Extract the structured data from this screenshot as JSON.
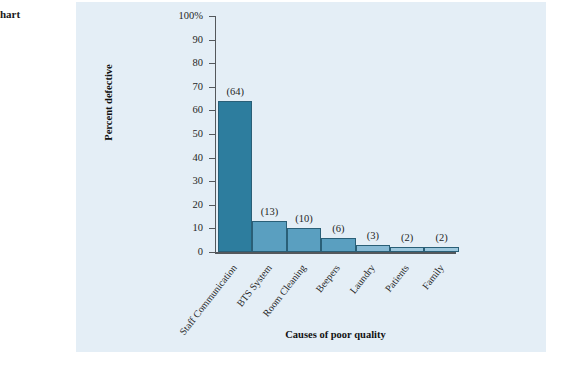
{
  "caption_fragment": "hart",
  "panel": {
    "background_color": "#e4eef6"
  },
  "chart_data": {
    "type": "bar",
    "title": "",
    "xlabel": "Causes of poor quality",
    "ylabel": "Percent defective",
    "categories": [
      "Staff Communication",
      "BTS System",
      "Room Cleaning",
      "Beepers",
      "Laundry",
      "Patients",
      "Family"
    ],
    "values": [
      64,
      13,
      10,
      6,
      3,
      2,
      2
    ],
    "data_labels": [
      "(64)",
      "(13)",
      "(10)",
      "(6)",
      "(3)",
      "(2)",
      "(2)"
    ],
    "ylim": [
      0,
      100
    ],
    "yticks": [
      0,
      10,
      20,
      30,
      40,
      50,
      60,
      70,
      80,
      90,
      100
    ],
    "ytick_labels": [
      "0",
      "10",
      "20",
      "30",
      "40",
      "50",
      "60",
      "70",
      "80",
      "90",
      "100%"
    ],
    "grid": false,
    "legend": "none",
    "bar_colors": [
      "#2d7d9e",
      "#5a9fc0",
      "#5a9fc0",
      "#5a9fc0",
      "#87bad5",
      "#9cc7dd",
      "#9cc7dd"
    ],
    "bar_edge_color": "#2a5f77"
  }
}
